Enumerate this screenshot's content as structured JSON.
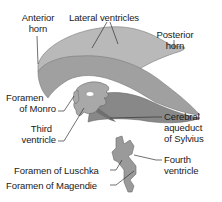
{
  "diagram": {
    "colors": {
      "light": "#b8b8b8",
      "mid": "#9a9a9a",
      "dark": "#838383",
      "outline": "#5a5a5a",
      "leader": "#333333"
    },
    "labels": {
      "anterior_horn": [
        "Anterior",
        "horn"
      ],
      "lateral_ventricles": "Lateral ventricles",
      "posterior_horn": [
        "Posterior",
        "horn"
      ],
      "foramen_of_monro": [
        "Foramen",
        "of Monro"
      ],
      "third_ventricle": [
        "Third",
        "ventricle"
      ],
      "cerebral_aqueduct": [
        "Cerebral",
        "aqueduct",
        "of Sylvius"
      ],
      "fourth_ventricle": [
        "Fourth",
        "ventricle"
      ],
      "foramen_of_luschka": "Foramen of Luschka",
      "foramen_of_magendie": "Foramen of Magendie"
    }
  }
}
